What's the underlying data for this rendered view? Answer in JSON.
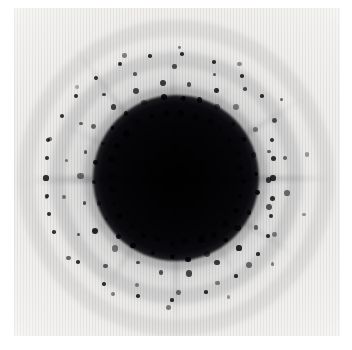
{
  "image": {
    "kind": "x-ray-diffraction-pattern",
    "title": "",
    "caption": "",
    "canvas": {
      "width": 352,
      "height": 350
    },
    "page_background": "#ffffff",
    "frame": {
      "x": 14,
      "y": 8,
      "width": 326,
      "height": 328,
      "background": "#efeeec",
      "note": "exposed detector / film area, inverted grayscale (dark = high intensity)"
    },
    "colormap": {
      "low": "#f4f3f1",
      "mid": "#9a9a9a",
      "high": "#0d0c0f",
      "inverted": true
    }
  },
  "chart_data": {
    "type": "heatmap",
    "title": "",
    "subtitle": "",
    "xlabel": "",
    "ylabel": "",
    "grid": false,
    "legend": "none",
    "xlim": [
      14,
      340
    ],
    "ylim": [
      8,
      336
    ],
    "tick_labels_x": [],
    "tick_labels_y": [],
    "annotations": [],
    "beam_center": {
      "x": 176,
      "y": 178
    },
    "core": {
      "label": "saturated direct-beam core",
      "radius": 57,
      "softness": 26,
      "color": "#0b0a0d"
    },
    "halo": {
      "label": "diffuse scatter halo",
      "inner_radius": 55,
      "outer_radius": 175,
      "peak_gray": "#8d8d8d"
    },
    "diffuse_rings": [
      {
        "radius": 92,
        "width": 13,
        "opacity": 0.2
      },
      {
        "radius": 126,
        "width": 15,
        "opacity": 0.14
      },
      {
        "radius": 158,
        "width": 16,
        "opacity": 0.09
      }
    ],
    "streaks": {
      "label": "radial streaks / rotation spikes",
      "count": 12,
      "angles_deg": [
        2,
        33,
        58,
        90,
        122,
        147,
        178,
        205,
        232,
        268,
        300,
        328
      ],
      "length": 150,
      "thickness": 4,
      "opacity": 0.3
    },
    "spot_rings": [
      {
        "name": "ring-1",
        "radius": 66,
        "n_spots": 28,
        "spot_size": 5.2,
        "phase_deg": 4,
        "opacity": 0.95
      },
      {
        "name": "ring-2",
        "radius": 80,
        "n_spots": 26,
        "spot_size": 5.0,
        "phase_deg": 11,
        "opacity": 0.92
      },
      {
        "name": "ring-3",
        "radius": 95,
        "n_spots": 22,
        "spot_size": 4.6,
        "phase_deg": 0,
        "opacity": 0.85
      },
      {
        "name": "ring-4",
        "radius": 112,
        "n_spots": 18,
        "spot_size": 4.2,
        "phase_deg": 9,
        "opacity": 0.7
      },
      {
        "name": "ring-5",
        "radius": 132,
        "n_spots": 14,
        "spot_size": 3.8,
        "phase_deg": 16,
        "opacity": 0.55
      }
    ],
    "layer_line_spots": [
      {
        "x": 272,
        "y": 140,
        "size": 4.6
      },
      {
        "x": 273,
        "y": 158,
        "size": 5.0
      },
      {
        "x": 273,
        "y": 178,
        "size": 5.2
      },
      {
        "x": 272,
        "y": 198,
        "size": 5.0
      },
      {
        "x": 271,
        "y": 216,
        "size": 4.2
      },
      {
        "x": 268,
        "y": 236,
        "size": 3.6
      },
      {
        "x": 48,
        "y": 140,
        "size": 4.4
      },
      {
        "x": 47,
        "y": 158,
        "size": 4.8
      },
      {
        "x": 46,
        "y": 178,
        "size": 5.2
      },
      {
        "x": 47,
        "y": 196,
        "size": 4.8
      },
      {
        "x": 49,
        "y": 214,
        "size": 4.2
      },
      {
        "x": 54,
        "y": 232,
        "size": 3.6
      },
      {
        "x": 62,
        "y": 116,
        "size": 4.0
      },
      {
        "x": 76,
        "y": 96,
        "size": 4.0
      },
      {
        "x": 96,
        "y": 78,
        "size": 4.0
      },
      {
        "x": 120,
        "y": 64,
        "size": 3.8
      },
      {
        "x": 150,
        "y": 56,
        "size": 3.6
      },
      {
        "x": 182,
        "y": 54,
        "size": 3.6
      },
      {
        "x": 214,
        "y": 62,
        "size": 3.6
      },
      {
        "x": 242,
        "y": 76,
        "size": 3.6
      },
      {
        "x": 262,
        "y": 96,
        "size": 3.6
      },
      {
        "x": 78,
        "y": 262,
        "size": 3.6
      },
      {
        "x": 104,
        "y": 284,
        "size": 3.4
      },
      {
        "x": 138,
        "y": 296,
        "size": 3.4
      },
      {
        "x": 172,
        "y": 300,
        "size": 3.2
      },
      {
        "x": 206,
        "y": 292,
        "size": 3.2
      },
      {
        "x": 236,
        "y": 276,
        "size": 3.2
      },
      {
        "x": 258,
        "y": 254,
        "size": 3.2
      }
    ],
    "equatorial_streak": {
      "label": "horizontal equator streak",
      "y": 178,
      "x_start": 30,
      "x_end": 330,
      "thickness": 5,
      "opacity": 0.22
    }
  }
}
